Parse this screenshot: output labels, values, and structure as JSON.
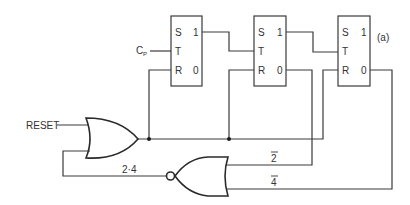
{
  "diagram": {
    "type": "logic circuit",
    "figure_label": "(a)",
    "colors": {
      "line": "#3a3a3a",
      "background": "#ffffff"
    },
    "flip_flops": [
      {
        "id": "ff1",
        "pins": {
          "s": "S",
          "t": "T",
          "r": "R",
          "q1": "1",
          "q0": "0"
        }
      },
      {
        "id": "ff2",
        "pins": {
          "s": "S",
          "t": "T",
          "r": "R",
          "q1": "1",
          "q0": "0"
        }
      },
      {
        "id": "ff3",
        "pins": {
          "s": "S",
          "t": "T",
          "r": "R",
          "q1": "1",
          "q0": "0"
        }
      }
    ],
    "inputs": {
      "clock_main": "C",
      "clock_sub": "P",
      "reset": "RESET"
    },
    "gates": {
      "or_gate": {
        "type": "OR",
        "inputs": [
          "RESET",
          "2·4"
        ],
        "output": "R (all flip-flops)"
      },
      "nor_gate": {
        "type": "NOR",
        "inputs": [
          "2̄",
          "4̄"
        ],
        "output": "2·4"
      }
    },
    "signal_labels": {
      "product": "2·4",
      "not2": "2",
      "not4": "4"
    }
  }
}
